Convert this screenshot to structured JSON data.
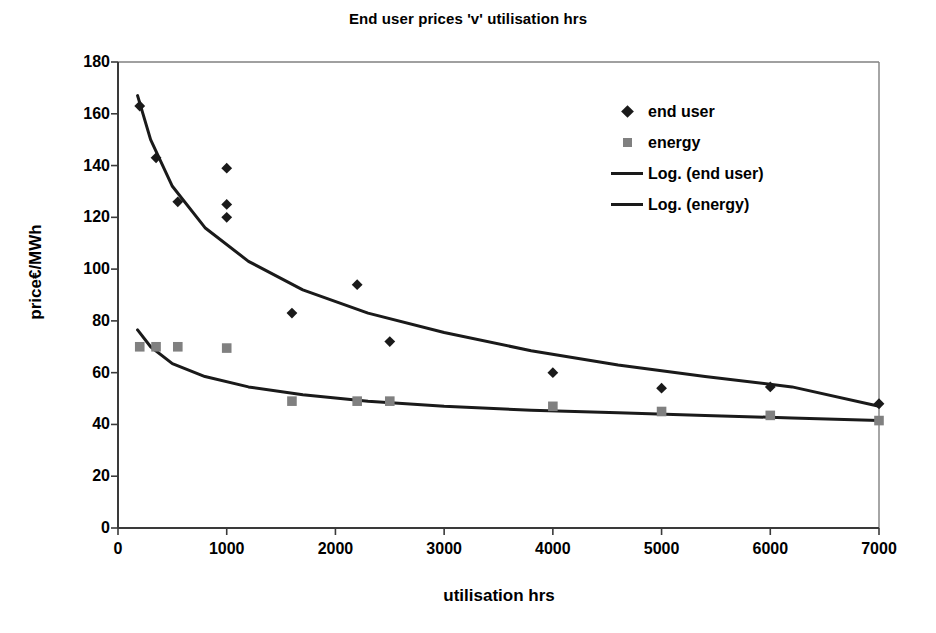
{
  "chart_data": {
    "type": "scatter",
    "title": "End user prices 'v' utilisation hrs",
    "xlabel": "utilisation hrs",
    "ylabel": "price€/MWh",
    "xlim": [
      0,
      7000
    ],
    "ylim": [
      0,
      180
    ],
    "xticks": [
      0,
      1000,
      2000,
      3000,
      4000,
      5000,
      6000,
      7000
    ],
    "yticks": [
      0,
      20,
      40,
      60,
      80,
      100,
      120,
      140,
      160,
      180
    ],
    "grid": false,
    "legend_position": "upper right",
    "legend": [
      "end user",
      "energy",
      "Log. (end user)",
      "Log. (energy)"
    ],
    "series": [
      {
        "name": "end user",
        "marker": "diamond",
        "color": "#1a1a1a",
        "x": [
          200,
          350,
          550,
          1000,
          1000,
          1000,
          1600,
          2200,
          2500,
          4000,
          5000,
          6000,
          7000
        ],
        "y": [
          163,
          143,
          126,
          139,
          125,
          120,
          83,
          94,
          72,
          60,
          54,
          54.5,
          48
        ]
      },
      {
        "name": "energy",
        "marker": "square",
        "color": "#808080",
        "x": [
          200,
          350,
          550,
          1000,
          1600,
          2200,
          2500,
          4000,
          5000,
          6000,
          7000
        ],
        "y": [
          70,
          70,
          70,
          69.5,
          49,
          49,
          49,
          47,
          45,
          43.5,
          41.5
        ]
      },
      {
        "name": "Log. (end user)",
        "marker": "line",
        "color": "#1a1a1a",
        "fit": "logarithmic",
        "x": [
          180,
          300,
          500,
          800,
          1200,
          1700,
          2300,
          3000,
          3800,
          4600,
          5400,
          6200,
          7000
        ],
        "y": [
          167,
          150,
          132,
          116,
          103,
          92,
          83,
          75.5,
          68.5,
          63,
          58.5,
          54.5,
          47
        ]
      },
      {
        "name": "Log. (energy)",
        "marker": "line",
        "color": "#1a1a1a",
        "fit": "logarithmic",
        "x": [
          180,
          300,
          500,
          800,
          1200,
          1700,
          2300,
          3000,
          3800,
          4600,
          5400,
          6200,
          7000
        ],
        "y": [
          76.5,
          70,
          63.5,
          58.5,
          54.5,
          51.5,
          49,
          47,
          45.5,
          44.5,
          43.5,
          42.5,
          41.5
        ]
      }
    ]
  },
  "axes": {
    "y_tick_labels": [
      "180",
      "160",
      "140",
      "120",
      "100",
      "80",
      "60",
      "40",
      "20",
      "0"
    ],
    "x_tick_labels": [
      "0",
      "1000",
      "2000",
      "3000",
      "4000",
      "5000",
      "6000",
      "7000"
    ]
  },
  "legend": {
    "items": [
      {
        "label": "end user",
        "key": "diamond-marker-icon"
      },
      {
        "label": "energy",
        "key": "square-marker-icon"
      },
      {
        "label": "Log. (end user)",
        "key": "line-marker-icon"
      },
      {
        "label": "Log. (energy)",
        "key": "line-marker-icon"
      }
    ]
  }
}
